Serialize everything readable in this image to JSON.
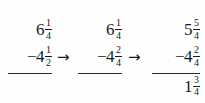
{
  "figure": {
    "background_color": "#fefefe",
    "text_color": "#1a1a1a"
  },
  "arrows": [
    {
      "glyph": "→",
      "name": "arrow-step-1-to-2"
    },
    {
      "glyph": "→",
      "name": "arrow-step-2-to-3"
    }
  ],
  "steps": [
    {
      "label": "step-1-original",
      "minuend": {
        "whole": "6",
        "numerator": "1",
        "denominator": "4"
      },
      "subtrahend": {
        "sign": "−",
        "whole": "4",
        "numerator": "1",
        "denominator": "2"
      },
      "result": null
    },
    {
      "label": "step-2-common-denominator",
      "minuend": {
        "whole": "6",
        "numerator": "1",
        "denominator": "4"
      },
      "subtrahend": {
        "sign": "−",
        "whole": "4",
        "numerator": "2",
        "denominator": "4"
      },
      "result": null
    },
    {
      "label": "step-3-regrouped-and-solved",
      "minuend": {
        "whole": "5",
        "numerator": "5",
        "denominator": "4"
      },
      "subtrahend": {
        "sign": "−",
        "whole": "4",
        "numerator": "2",
        "denominator": "4"
      },
      "result": {
        "whole": "1",
        "numerator": "3",
        "denominator": "4"
      }
    }
  ]
}
